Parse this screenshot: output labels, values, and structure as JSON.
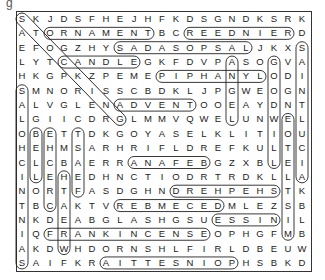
{
  "puzzle": {
    "corner_glyph": "g",
    "rows": [
      "SKJDSFHEJHFKDSGNDKSRK",
      "ATORNAMENTBCREEDNIERD",
      "EFOGZHYSADASOPSALJKXS",
      "LYTCANDLEGKFDVPASOGVA",
      "HKGPKZPEMEPIPHANYLODI",
      "SMNORISSCBDKLJPGWEOGN",
      "ALVGLENADVENTOOEAYDNT",
      "LGIICDRGLMMVQWELUNWEL",
      "OBETTDKGOYASELKLITIOU",
      "HEHMSARHRIFLDREFKULTC",
      "CLCBAERRANAFEBGZXBLEI",
      "ILEHEDHNCTIODRTRDKLLA",
      "NORTFASDGHNDREHPEHSTK",
      "TBCAKTVREBMECEDMLEZSB",
      "NKDEABGLASHGSUESSINIL",
      "IQFRANKINCENSEOPHGFMB",
      "AKDWHDORNSHLFIRLDBEUW",
      "SAIFKRAITTESNIOPHSBKD"
    ],
    "found_words": [
      {
        "word": "STOCKING",
        "start": [
          1,
          1
        ],
        "end": [
          8,
          8
        ]
      },
      {
        "word": "ORNAMENT",
        "start": [
          2,
          3
        ],
        "end": [
          2,
          10
        ]
      },
      {
        "word": "REINDEER",
        "start": [
          2,
          20
        ],
        "end": [
          2,
          13
        ]
      },
      {
        "word": "LAS POSADAS",
        "start": [
          3,
          17
        ],
        "end": [
          3,
          8
        ]
      },
      {
        "word": "CANDLE",
        "start": [
          4,
          4
        ],
        "end": [
          4,
          9
        ]
      },
      {
        "word": "EPIPHANY",
        "start": [
          5,
          11
        ],
        "end": [
          5,
          18
        ]
      },
      {
        "word": "ADVENT",
        "start": [
          7,
          8
        ],
        "end": [
          7,
          13
        ]
      },
      {
        "word": "BEFANA",
        "start": [
          11,
          14
        ],
        "end": [
          11,
          9
        ]
      },
      {
        "word": "SHEPHERD",
        "start": [
          13,
          19
        ],
        "end": [
          13,
          12
        ]
      },
      {
        "word": "DECEMBER",
        "start": [
          14,
          15
        ],
        "end": [
          14,
          8
        ]
      },
      {
        "word": "NISSE",
        "start": [
          15,
          19
        ],
        "end": [
          15,
          15
        ]
      },
      {
        "word": "FRANKINCENSE",
        "start": [
          16,
          3
        ],
        "end": [
          16,
          14
        ]
      },
      {
        "word": "POINSETTIA",
        "start": [
          18,
          16
        ],
        "end": [
          18,
          7
        ]
      },
      {
        "word": "SAINT NICHOLAS",
        "start": [
          18,
          1
        ],
        "end": [
          6,
          1
        ]
      },
      {
        "word": "BELL",
        "start": [
          9,
          2
        ],
        "end": [
          12,
          2
        ]
      },
      {
        "word": "CRECHE",
        "start": [
          14,
          3
        ],
        "end": [
          9,
          3
        ]
      },
      {
        "word": "WREATH",
        "start": [
          17,
          4
        ],
        "end": [
          12,
          4
        ]
      },
      {
        "word": "FEAST",
        "start": [
          13,
          5
        ],
        "end": [
          9,
          5
        ]
      },
      {
        "word": "ANGEL",
        "start": [
          4,
          16
        ],
        "end": [
          8,
          16
        ]
      },
      {
        "word": "GOODWILL",
        "start": [
          4,
          19
        ],
        "end": [
          11,
          19
        ]
      },
      {
        "word": "MISTLETOE",
        "start": [
          16,
          20
        ],
        "end": [
          8,
          20
        ]
      },
      {
        "word": "SAINT LUCIA",
        "start": [
          3,
          21
        ],
        "end": [
          12,
          21
        ]
      }
    ]
  }
}
